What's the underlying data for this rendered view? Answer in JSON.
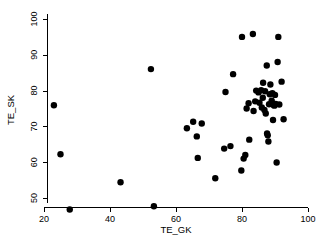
{
  "chart_data": {
    "type": "scatter",
    "title": "",
    "subtitle": "",
    "xlabel": "TE_GK",
    "ylabel": "TE_SK",
    "xlim": [
      18,
      102
    ],
    "ylim": [
      45.5,
      101.5
    ],
    "xticks": [
      20,
      40,
      60,
      80,
      100
    ],
    "xtick_labels": [
      "20",
      "40",
      "60",
      "80",
      "100"
    ],
    "yticks": [
      50,
      60,
      70,
      80,
      90,
      100
    ],
    "ytick_labels": [
      "50",
      "60",
      "70",
      "80",
      "90",
      "100"
    ],
    "grid": false,
    "legend": null,
    "marker": "filled-circle",
    "marker_color": "#000000",
    "marker_size": 3.2,
    "n_points": 56,
    "points": [
      [
        23.0,
        75.9
      ],
      [
        25.0,
        62.2
      ],
      [
        27.8,
        46.8
      ],
      [
        43.2,
        54.4
      ],
      [
        52.4,
        86.0
      ],
      [
        53.3,
        47.7
      ],
      [
        63.3,
        69.5
      ],
      [
        65.2,
        71.3
      ],
      [
        66.3,
        67.2
      ],
      [
        66.6,
        61.2
      ],
      [
        67.8,
        70.8
      ],
      [
        71.9,
        55.5
      ],
      [
        74.6,
        63.8
      ],
      [
        75.0,
        79.6
      ],
      [
        76.5,
        64.5
      ],
      [
        77.3,
        84.6
      ],
      [
        79.8,
        57.7
      ],
      [
        80.0,
        95.0
      ],
      [
        80.5,
        61.0
      ],
      [
        81.0,
        62.0
      ],
      [
        81.4,
        75.0
      ],
      [
        82.0,
        76.5
      ],
      [
        82.2,
        66.3
      ],
      [
        83.3,
        95.8
      ],
      [
        83.5,
        74.3
      ],
      [
        84.0,
        77.0
      ],
      [
        84.3,
        80.0
      ],
      [
        85.0,
        79.5
      ],
      [
        85.3,
        76.6
      ],
      [
        85.8,
        80.1
      ],
      [
        86.0,
        75.3
      ],
      [
        86.3,
        78.0
      ],
      [
        86.4,
        82.2
      ],
      [
        87.0,
        79.8
      ],
      [
        87.2,
        73.6
      ],
      [
        87.5,
        87.0
      ],
      [
        87.6,
        68.0
      ],
      [
        87.8,
        67.5
      ],
      [
        88.0,
        65.8
      ],
      [
        88.2,
        76.2
      ],
      [
        88.4,
        79.0
      ],
      [
        88.6,
        81.7
      ],
      [
        89.0,
        77.2
      ],
      [
        89.2,
        79.3
      ],
      [
        89.4,
        71.8
      ],
      [
        89.6,
        76.0
      ],
      [
        89.8,
        75.8
      ],
      [
        90.0,
        78.8
      ],
      [
        90.2,
        76.3
      ],
      [
        90.5,
        59.9
      ],
      [
        90.8,
        88.0
      ],
      [
        91.0,
        95.0
      ],
      [
        91.3,
        76.1
      ],
      [
        92.0,
        82.5
      ],
      [
        92.6,
        72.0
      ],
      [
        86.8,
        74.6
      ]
    ]
  },
  "axes": {
    "x_axis_name": "x-axis",
    "y_axis_name": "y-axis"
  }
}
